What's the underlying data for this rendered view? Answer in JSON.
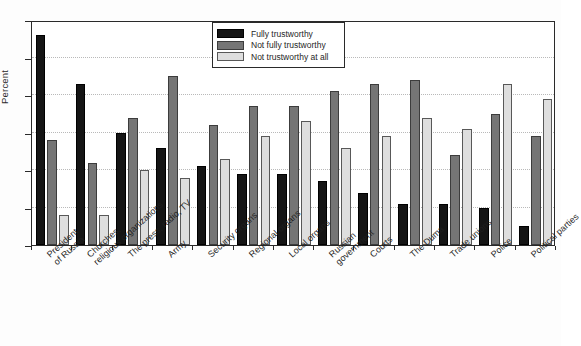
{
  "chart_data": {
    "type": "bar",
    "title": "",
    "xlabel": "",
    "ylabel": "Percent",
    "ylim": [
      0,
      60
    ],
    "yticks": [
      0,
      10,
      20,
      30,
      40,
      50,
      60
    ],
    "grid": true,
    "legend_position": "top-center",
    "categories": [
      "President of Russia",
      "Churches, religious organizations",
      "The press, radio, TV",
      "Army",
      "Security organs",
      "Regional organs",
      "Local organs",
      "Russian government",
      "Courts",
      "The Duma",
      "Trade unions",
      "Police",
      "Political parties"
    ],
    "category_lines": [
      [
        "President",
        "of Russia"
      ],
      [
        "Churches,",
        "religious organizations"
      ],
      [
        "The press, radio, TV"
      ],
      [
        "Army"
      ],
      [
        "Security organs"
      ],
      [
        "Regional organs"
      ],
      [
        "Local organs"
      ],
      [
        "Russian",
        "government"
      ],
      [
        "Courts"
      ],
      [
        "The Duma"
      ],
      [
        "Trade unions"
      ],
      [
        "Police"
      ],
      [
        "Political parties"
      ]
    ],
    "series": [
      {
        "name": "Fully trustworthy",
        "color": "#151515",
        "values": [
          56,
          43,
          30,
          26,
          21,
          19,
          19,
          17,
          14,
          11,
          11,
          10,
          5
        ]
      },
      {
        "name": "Not fully trustworthy",
        "color": "#757575",
        "values": [
          28,
          22,
          34,
          45,
          32,
          37,
          37,
          41,
          43,
          44,
          24,
          35,
          29
        ]
      },
      {
        "name": "Not trustworthy at all",
        "color": "#dedede",
        "values": [
          8,
          8,
          20,
          18,
          23,
          29,
          33,
          26,
          29,
          34,
          31,
          43,
          39
        ]
      }
    ]
  }
}
